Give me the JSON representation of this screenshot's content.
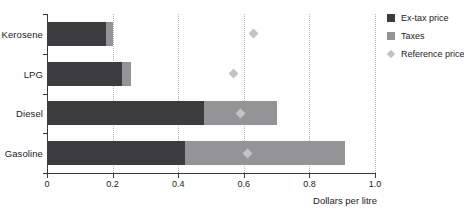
{
  "chart_data": {
    "type": "bar",
    "orientation": "horizontal",
    "stacked": true,
    "categories": [
      "Kerosene",
      "LPG",
      "Diesel",
      "Gasoline"
    ],
    "series": [
      {
        "name": "Ex-tax price",
        "color": "#3c3c3e",
        "values": [
          0.18,
          0.23,
          0.48,
          0.42
        ]
      },
      {
        "name": "Taxes",
        "color": "#949496",
        "values": [
          0.02,
          0.025,
          0.22,
          0.49
        ]
      }
    ],
    "markers": {
      "name": "Reference price",
      "color": "#c3c3c5",
      "values": [
        0.63,
        0.57,
        0.59,
        0.61
      ]
    },
    "xlabel": "Dollars per litre",
    "xlim": [
      0,
      1.0
    ],
    "xticks": [
      0,
      0.2,
      0.4,
      0.6,
      0.8,
      1.0
    ],
    "xtick_labels": [
      "0",
      "0.2",
      "0.4",
      "0.6",
      "0.8",
      "1.0"
    ],
    "grid": "vertical-dotted",
    "legend_position": "top-right"
  },
  "legend": {
    "items": [
      {
        "label": "Ex-tax price",
        "swatch": "square",
        "color": "#3c3c3e"
      },
      {
        "label": "Taxes",
        "swatch": "square",
        "color": "#949496"
      },
      {
        "label": "Reference price",
        "swatch": "diamond",
        "color": "#c3c3c5"
      }
    ]
  }
}
